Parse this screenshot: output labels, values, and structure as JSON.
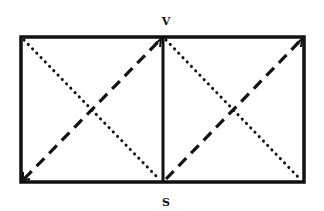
{
  "diagram": {
    "labels": {
      "top": "V",
      "bottom": "S"
    },
    "colors": {
      "stroke": "#111111",
      "background": "#ffffff"
    },
    "geometry": {
      "rect": {
        "x1": 21,
        "y1": 37,
        "x2": 304,
        "y2": 182
      },
      "divider_x": 163
    },
    "squares": [
      {
        "name": "left",
        "dotted_diagonal": "top-left to bottom-right",
        "dashed_diagonal": "bottom-left to top-right"
      },
      {
        "name": "right",
        "dotted_diagonal": "top-left to bottom-right",
        "dashed_diagonal": "bottom-left to top-right"
      }
    ]
  }
}
